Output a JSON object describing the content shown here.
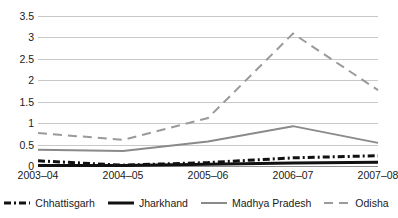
{
  "chart_data": {
    "type": "line",
    "title": "",
    "xlabel": "",
    "ylabel": "",
    "categories": [
      "2003–04",
      "2004–05",
      "2005–06",
      "2006–07",
      "2007–08"
    ],
    "ylim": [
      0,
      3.5
    ],
    "yticks": [
      "0",
      "0.5",
      "1",
      "1.5",
      "2",
      "2.5",
      "3",
      "3.5"
    ],
    "ytick_values": [
      0,
      0.5,
      1,
      1.5,
      2,
      2.5,
      3,
      3.5
    ],
    "grid": true,
    "legend_position": "bottom",
    "series": [
      {
        "name": "Chhattisgarh",
        "values": [
          0.12,
          0.02,
          0.08,
          0.19,
          0.24
        ],
        "color": "#111111",
        "style": "dash-dot",
        "width": 3,
        "dasharray": "7,3,2,3"
      },
      {
        "name": "Jharkhand",
        "values": [
          0.01,
          0.01,
          0.04,
          0.07,
          0.09
        ],
        "color": "#111111",
        "style": "solid",
        "width": 3,
        "dasharray": "none"
      },
      {
        "name": "Madhya Pradesh",
        "values": [
          0.38,
          0.35,
          0.57,
          0.93,
          0.54
        ],
        "color": "#8a8a8a",
        "style": "solid",
        "width": 2,
        "dasharray": "none"
      },
      {
        "name": "Odisha",
        "values": [
          0.77,
          0.61,
          1.12,
          3.09,
          1.77
        ],
        "color": "#9a9a9a",
        "style": "dashed",
        "width": 2,
        "dasharray": "9,6"
      }
    ]
  },
  "legend": {
    "items": [
      {
        "label": "Chhattisgarh"
      },
      {
        "label": "Jharkhand"
      },
      {
        "label": "Madhya Pradesh"
      },
      {
        "label": "Odisha"
      }
    ]
  },
  "colors": {
    "gridline": "#c9c9c9",
    "axis": "#8f8f8f",
    "text": "#1a1a1a",
    "background": "#ffffff"
  }
}
